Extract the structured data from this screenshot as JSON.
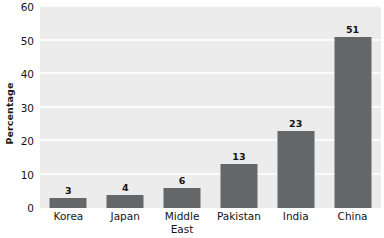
{
  "chart_data": {
    "type": "bar",
    "title": "",
    "subtitle": "",
    "xlabel": "",
    "ylabel": "Percentage",
    "categories": [
      "Korea",
      "Japan",
      "Middle East",
      "Pakistan",
      "India",
      "China"
    ],
    "category_lines": [
      [
        "Korea"
      ],
      [
        "Japan"
      ],
      [
        "Middle",
        "East"
      ],
      [
        "Pakistan"
      ],
      [
        "India"
      ],
      [
        "China"
      ]
    ],
    "values": [
      3,
      4,
      6,
      13,
      23,
      51
    ],
    "value_labels": [
      "3",
      "4",
      "6",
      "13",
      "23",
      "51"
    ],
    "ylim": [
      0,
      60
    ],
    "yticks": [
      0,
      10,
      20,
      30,
      40,
      50,
      60
    ],
    "ytick_labels": [
      "0",
      "10",
      "20",
      "30",
      "40",
      "50",
      "60"
    ],
    "grid": true,
    "grid_axis": "y",
    "legend": false,
    "legend_position": "none",
    "colors": {
      "bar_fill": "#646668",
      "plot_background": "#ececec",
      "gridline": "#fbfbfb",
      "text": "#141414",
      "figure_background": "#ffffff"
    }
  }
}
